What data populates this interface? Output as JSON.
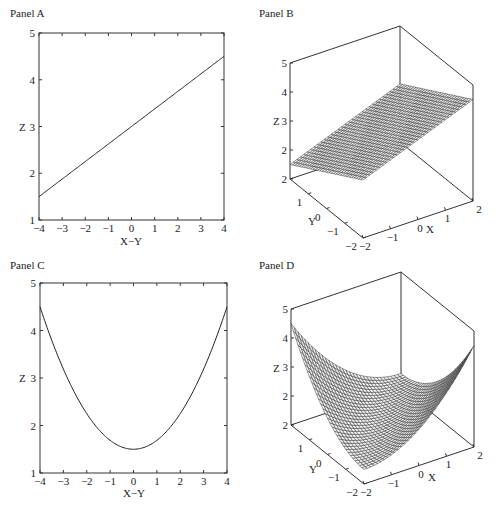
{
  "figure": {
    "panels": [
      {
        "id": "A",
        "title": "Panel A"
      },
      {
        "id": "B",
        "title": "Panel B"
      },
      {
        "id": "C",
        "title": "Panel C"
      },
      {
        "id": "D",
        "title": "Panel D"
      }
    ]
  },
  "chart_data": [
    {
      "panel": "Panel A",
      "type": "line",
      "title": "Panel A",
      "xlabel": "X−Y",
      "ylabel": "Z",
      "xlim": [
        -4,
        4
      ],
      "ylim": [
        1,
        5
      ],
      "xticks": [
        "−4",
        "−3",
        "−2",
        "−1",
        "0",
        "1",
        "2",
        "3",
        "4"
      ],
      "yticks": [
        "1",
        "2",
        "3",
        "4",
        "5"
      ],
      "grid": false,
      "x": [
        -4,
        -3,
        -2,
        -1,
        0,
        1,
        2,
        3,
        4
      ],
      "series": [
        {
          "name": "Z",
          "values": [
            1.5,
            1.875,
            2.25,
            2.625,
            3.0,
            3.375,
            3.75,
            4.125,
            4.5
          ]
        }
      ]
    },
    {
      "panel": "Panel B",
      "type": "surface",
      "title": "Panel B",
      "xlabel": "X",
      "ylabel": "Y",
      "zlabel": "Z",
      "xlim": [
        -2,
        2
      ],
      "ylim": [
        -2,
        2
      ],
      "zlim": [
        1,
        5
      ],
      "xticks": [
        "−2",
        "−1",
        "0",
        "1",
        "2"
      ],
      "yticks": [
        "−2",
        "−1",
        "0",
        "1",
        "2"
      ],
      "zticks": [
        "2",
        "2",
        "3",
        "4",
        "5"
      ],
      "surface": "plane Z = 3 + 0.375·(X−Y)",
      "corner_values": {
        "X=-2,Y=2": 1.5,
        "X=-2,Y=-2": 3.0,
        "X=2,Y=-2": 4.5,
        "X=2,Y=2": 3.0
      }
    },
    {
      "panel": "Panel C",
      "type": "line",
      "title": "Panel C",
      "xlabel": "X−Y",
      "ylabel": "Z",
      "xlim": [
        -4,
        4
      ],
      "ylim": [
        1,
        5
      ],
      "xticks": [
        "−4",
        "−3",
        "−2",
        "−1",
        "0",
        "1",
        "2",
        "3",
        "4"
      ],
      "yticks": [
        "1",
        "2",
        "3",
        "4",
        "5"
      ],
      "grid": false,
      "x": [
        -4,
        -3,
        -2,
        -1,
        0,
        1,
        2,
        3,
        4
      ],
      "series": [
        {
          "name": "Z",
          "values": [
            4.5,
            3.19,
            2.25,
            1.69,
            1.5,
            1.69,
            2.25,
            3.19,
            4.5
          ]
        }
      ]
    },
    {
      "panel": "Panel D",
      "type": "surface",
      "title": "Panel D",
      "xlabel": "X",
      "ylabel": "Y",
      "zlabel": "Z",
      "xlim": [
        -2,
        2
      ],
      "ylim": [
        -2,
        2
      ],
      "zlim": [
        1,
        5
      ],
      "xticks": [
        "−2",
        "−1",
        "0",
        "1",
        "2"
      ],
      "yticks": [
        "−2",
        "−1",
        "0",
        "1",
        "2"
      ],
      "zticks": [
        "2",
        "2",
        "3",
        "4",
        "5"
      ],
      "surface": "parabolic trough Z = 1.5 + (3/16)·(X−Y)²",
      "corner_values": {
        "X=-2,Y=2": 4.5,
        "X=-2,Y=-2": 1.5,
        "X=2,Y=-2": 4.5,
        "X=2,Y=2": 1.5
      }
    }
  ]
}
